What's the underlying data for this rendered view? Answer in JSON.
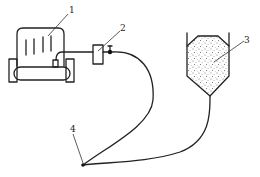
{
  "diagram": {
    "type": "schematic",
    "colors": {
      "stroke": "#222222",
      "background": "#ffffff",
      "fill_speckle": "#555555"
    },
    "labels": [
      {
        "id": "1",
        "text": "1",
        "refers_to": "machine"
      },
      {
        "id": "2",
        "text": "2",
        "refers_to": "inline-device"
      },
      {
        "id": "3",
        "text": "3",
        "refers_to": "hopper"
      },
      {
        "id": "4",
        "text": "4",
        "refers_to": "nozzle"
      }
    ],
    "components": [
      {
        "name": "machine",
        "label": "1"
      },
      {
        "name": "inline-device",
        "label": "2"
      },
      {
        "name": "hopper",
        "label": "3"
      },
      {
        "name": "nozzle",
        "label": "4"
      }
    ]
  }
}
